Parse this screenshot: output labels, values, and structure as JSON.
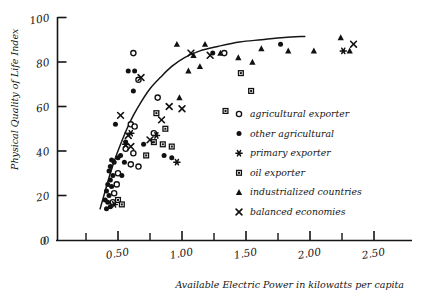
{
  "chart_data": {
    "type": "scatter",
    "title": "",
    "xlabel": "Available Electric Power in kilowatts per capita",
    "ylabel": "Physical Quality of Life Index",
    "xlim": [
      0.0,
      2.75
    ],
    "ylim": [
      0,
      100
    ],
    "grid": false,
    "legend_position": "inside-right",
    "x_tick_labels": [
      "0",
      "0.50",
      "1.00",
      "1.50",
      "2.00",
      "2.50"
    ],
    "x_tick_values": [
      0.0,
      0.5,
      1.0,
      1.5,
      2.0,
      2.5
    ],
    "x_minor_tick_values": [
      0.25,
      0.75,
      1.25,
      1.75,
      2.25
    ],
    "y_tick_labels": [
      "0",
      "20",
      "40",
      "60",
      "80",
      "100"
    ],
    "y_tick_values": [
      0,
      20,
      40,
      60,
      80,
      100
    ],
    "origin_label": "0",
    "trend_curve": {
      "name": "fitted logarithmic trend",
      "points": [
        [
          0.36,
          14
        ],
        [
          0.4,
          22
        ],
        [
          0.44,
          30
        ],
        [
          0.48,
          37
        ],
        [
          0.52,
          43
        ],
        [
          0.57,
          50
        ],
        [
          0.62,
          56
        ],
        [
          0.68,
          62
        ],
        [
          0.75,
          68
        ],
        [
          0.83,
          73
        ],
        [
          0.92,
          78
        ],
        [
          1.02,
          82
        ],
        [
          1.14,
          85
        ],
        [
          1.28,
          87
        ],
        [
          1.45,
          89
        ],
        [
          1.62,
          90
        ],
        [
          1.8,
          91
        ],
        [
          1.96,
          91.5
        ]
      ]
    },
    "series": [
      {
        "name": "agricultural exporter",
        "marker": "open-circle",
        "color": "#111111",
        "points": [
          [
            0.62,
            84
          ],
          [
            0.66,
            72
          ],
          [
            0.6,
            52
          ],
          [
            0.63,
            51
          ],
          [
            0.56,
            41
          ],
          [
            0.62,
            39
          ],
          [
            0.6,
            34
          ],
          [
            0.66,
            33
          ],
          [
            0.5,
            30
          ],
          [
            0.49,
            25
          ],
          [
            0.47,
            21
          ],
          [
            0.46,
            17
          ],
          [
            0.81,
            64
          ],
          [
            0.78,
            48
          ],
          [
            1.33,
            84
          ]
        ]
      },
      {
        "name": "other agricultural",
        "marker": "filled-circle",
        "color": "#111111",
        "points": [
          [
            0.58,
            76
          ],
          [
            0.63,
            76
          ],
          [
            0.62,
            67
          ],
          [
            0.48,
            52
          ],
          [
            0.56,
            44
          ],
          [
            0.7,
            43
          ],
          [
            0.52,
            38
          ],
          [
            0.5,
            37
          ],
          [
            0.45,
            36
          ],
          [
            0.47,
            35
          ],
          [
            0.55,
            35
          ],
          [
            0.44,
            33
          ],
          [
            0.43,
            31
          ],
          [
            0.46,
            29
          ],
          [
            0.53,
            29
          ],
          [
            0.44,
            27
          ],
          [
            0.42,
            25
          ],
          [
            0.45,
            24
          ],
          [
            0.41,
            22
          ],
          [
            0.43,
            20
          ],
          [
            0.4,
            18
          ],
          [
            0.42,
            17
          ],
          [
            0.44,
            15
          ],
          [
            0.41,
            14
          ],
          [
            0.86,
            38
          ],
          [
            0.92,
            37
          ],
          [
            1.24,
            84
          ],
          [
            1.77,
            88
          ]
        ]
      },
      {
        "name": "primary exporter",
        "marker": "asterisk",
        "color": "#111111",
        "points": [
          [
            0.6,
            48
          ],
          [
            0.56,
            43
          ],
          [
            0.8,
            47
          ],
          [
            0.96,
            35
          ],
          [
            0.47,
            16
          ],
          [
            2.26,
            85
          ]
        ]
      },
      {
        "name": "oil exporter",
        "marker": "open-square",
        "color": "#111111",
        "points": [
          [
            0.8,
            57
          ],
          [
            0.87,
            50
          ],
          [
            0.78,
            44
          ],
          [
            0.85,
            43
          ],
          [
            0.92,
            42
          ],
          [
            0.72,
            38
          ],
          [
            0.5,
            18
          ],
          [
            0.53,
            16
          ],
          [
            1.34,
            58
          ],
          [
            1.46,
            75
          ],
          [
            1.54,
            67
          ]
        ]
      },
      {
        "name": "industrialized countries",
        "marker": "filled-triangle",
        "color": "#111111",
        "points": [
          [
            0.96,
            88
          ],
          [
            1.09,
            83
          ],
          [
            1.18,
            88
          ],
          [
            1.14,
            78
          ],
          [
            1.05,
            76
          ],
          [
            0.98,
            64
          ],
          [
            1.3,
            84
          ],
          [
            1.44,
            82
          ],
          [
            1.55,
            80
          ],
          [
            1.62,
            86
          ],
          [
            1.83,
            85
          ],
          [
            2.03,
            85
          ],
          [
            2.24,
            91
          ],
          [
            2.31,
            85
          ]
        ]
      },
      {
        "name": "balanced economies",
        "marker": "cross",
        "color": "#111111",
        "points": [
          [
            0.68,
            73
          ],
          [
            0.9,
            60
          ],
          [
            0.84,
            54
          ],
          [
            0.75,
            45
          ],
          [
            0.58,
            47
          ],
          [
            0.6,
            42
          ],
          [
            1.0,
            59
          ],
          [
            1.07,
            84
          ],
          [
            1.22,
            83
          ],
          [
            2.34,
            88
          ],
          [
            0.52,
            56
          ]
        ]
      }
    ]
  },
  "legend": {
    "items": [
      {
        "label": "agricultural exporter",
        "marker": "open-circle"
      },
      {
        "label": "other agricultural",
        "marker": "filled-circle"
      },
      {
        "label": "primary exporter",
        "marker": "asterisk"
      },
      {
        "label": "oil exporter",
        "marker": "open-square"
      },
      {
        "label": "industrialized countries",
        "marker": "filled-triangle"
      },
      {
        "label": "balanced economies",
        "marker": "cross"
      }
    ]
  }
}
